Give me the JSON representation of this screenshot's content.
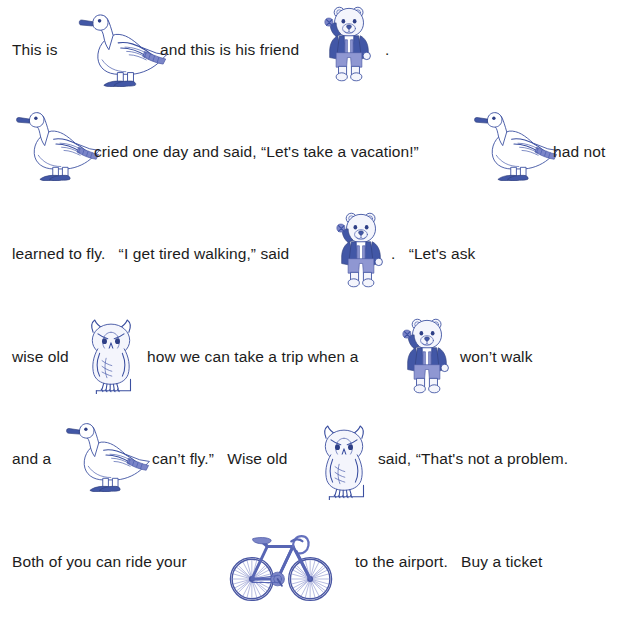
{
  "document": {
    "type": "rebus-reading-worksheet",
    "background_color": "#ffffff",
    "text_color": "#1c1c1c",
    "art_color": "#3b4fa0",
    "art_accent_color": "#8f97d2"
  },
  "lines": [
    {
      "id": "line-1",
      "segments": [
        {
          "kind": "text",
          "value": "This is"
        },
        {
          "kind": "image",
          "name": "duck",
          "alt": "duck"
        },
        {
          "kind": "text",
          "value": "and this is his friend"
        },
        {
          "kind": "image",
          "name": "bear",
          "alt": "bear"
        },
        {
          "kind": "text",
          "value": "."
        }
      ]
    },
    {
      "id": "line-2",
      "segments": [
        {
          "kind": "image",
          "name": "duck",
          "alt": "duck"
        },
        {
          "kind": "text",
          "value": "cried one day and said, “Let's take a vacation!”"
        },
        {
          "kind": "image",
          "name": "duck",
          "alt": "duck"
        },
        {
          "kind": "text",
          "value": "had not"
        }
      ]
    },
    {
      "id": "line-3",
      "segments": [
        {
          "kind": "text",
          "value": "learned to fly.   “I get tired walking,” said"
        },
        {
          "kind": "image",
          "name": "bear",
          "alt": "bear"
        },
        {
          "kind": "text",
          "value": ".   “Let's ask"
        }
      ]
    },
    {
      "id": "line-4",
      "segments": [
        {
          "kind": "text",
          "value": "wise old"
        },
        {
          "kind": "image",
          "name": "owl",
          "alt": "owl"
        },
        {
          "kind": "text",
          "value": "how we can take a trip when a"
        },
        {
          "kind": "image",
          "name": "bear",
          "alt": "bear"
        },
        {
          "kind": "text",
          "value": "won’t walk"
        }
      ]
    },
    {
      "id": "line-5",
      "segments": [
        {
          "kind": "text",
          "value": "and a"
        },
        {
          "kind": "image",
          "name": "duck",
          "alt": "duck"
        },
        {
          "kind": "text",
          "value": "can’t fly.”   Wise old"
        },
        {
          "kind": "image",
          "name": "owl",
          "alt": "owl"
        },
        {
          "kind": "text",
          "value": "said, “That's not a problem."
        }
      ]
    },
    {
      "id": "line-6",
      "segments": [
        {
          "kind": "text",
          "value": "Both of you can ride your"
        },
        {
          "kind": "image",
          "name": "bicycle",
          "alt": "bicycle"
        },
        {
          "kind": "text",
          "value": "to the airport.   Buy a ticket"
        }
      ]
    }
  ],
  "text": {
    "l1_a": "This is",
    "l1_b": "and this is his friend",
    "l1_c": ".",
    "l2_a": "cried one day and said, “Let's take a vacation!”",
    "l2_b": "had not",
    "l3_a": "learned to fly.   “I get tired walking,” said",
    "l3_b": ".   “Let's ask",
    "l4_a": "wise old",
    "l4_b": "how we can take a trip when a",
    "l4_c": "won’t walk",
    "l5_a": "and a",
    "l5_b": "can’t fly.”   Wise old",
    "l5_c": "said, “That's not a problem.",
    "l6_a": "Both of you can ride your",
    "l6_b": "to the airport.   Buy a ticket"
  },
  "icons": {
    "duck": "duck-icon",
    "bear": "bear-icon",
    "owl": "owl-icon",
    "bicycle": "bicycle-icon"
  }
}
